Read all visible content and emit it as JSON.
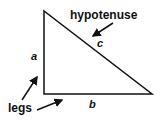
{
  "diagram": {
    "labels": {
      "hypotenuse": "hypotenuse",
      "side_a": "a",
      "side_b": "b",
      "side_c": "c",
      "legs": "legs"
    },
    "colors": {
      "stroke": "#111111",
      "background": "#ffffff"
    }
  }
}
